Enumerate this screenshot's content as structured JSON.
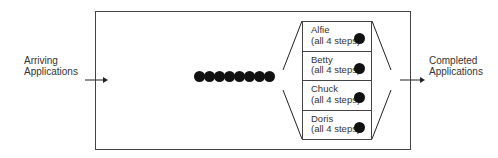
{
  "diagram": {
    "left_label": [
      "Arriving",
      "Applications"
    ],
    "right_label": [
      "Completed",
      "Applications"
    ],
    "queue_count": 8,
    "workers": [
      {
        "name": "Alfie",
        "task": "(all 4 steps)"
      },
      {
        "name": "Betty",
        "task": "(all 4 steps)"
      },
      {
        "name": "Chuck",
        "task": "(all 4 steps)"
      },
      {
        "name": "Doris",
        "task": "(all 4 steps)"
      }
    ]
  }
}
